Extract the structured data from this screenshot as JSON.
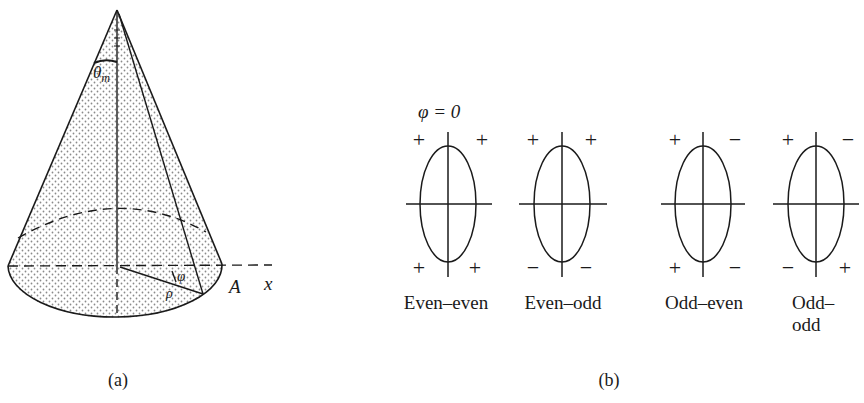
{
  "figure": {
    "panels": [
      {
        "id": "a",
        "caption": "(a)",
        "description": "Cone with stippled shading, apex angle theta_m, base ellipse, radial line rho at angle phi from x axis",
        "labels": {
          "theta": "θ",
          "theta_sub": "m",
          "phi": "φ",
          "rho": "ρ",
          "point": "A",
          "axis": "x"
        }
      },
      {
        "id": "b",
        "caption": "(b)",
        "phi_label": "φ = 0",
        "diagrams": [
          {
            "name": "Even–even",
            "signs": {
              "top_left": "+",
              "top_right": "+",
              "bottom_left": "+",
              "bottom_right": "+"
            }
          },
          {
            "name": "Even–odd",
            "signs": {
              "top_left": "+",
              "top_right": "+",
              "bottom_left": "−",
              "bottom_right": "−"
            }
          },
          {
            "name": "Odd–even",
            "signs": {
              "top_left": "+",
              "top_right": "−",
              "bottom_left": "+",
              "bottom_right": "−"
            }
          },
          {
            "name": "Odd–odd",
            "signs": {
              "top_left": "+",
              "top_right": "−",
              "bottom_left": "−",
              "bottom_right": "+"
            }
          }
        ]
      }
    ]
  },
  "colors": {
    "ink": "#1a1a1a",
    "stipple": "#8a8a8a",
    "background": "#ffffff"
  }
}
